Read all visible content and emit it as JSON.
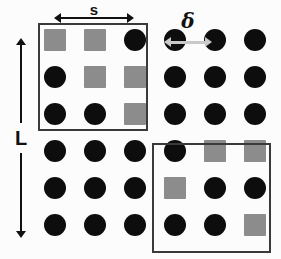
{
  "figure": {
    "width": 281,
    "height": 259,
    "background_color": "#fcfcfc"
  },
  "colors": {
    "circle": "#0d0d0d",
    "square": "#8c8c8c",
    "box_border": "#3a3a3a",
    "arrow_dark": "#111111",
    "arrow_light": "#c9c9c9"
  },
  "annotations": {
    "s": {
      "label": "s",
      "meaning": "domain-size-arrow",
      "orientation": "horizontal",
      "x": 54,
      "y": 4,
      "length": 80
    },
    "delta": {
      "label": "δ",
      "meaning": "lattice-spacing-arrow",
      "orientation": "horizontal",
      "x": 164,
      "y": 14,
      "length": 48
    },
    "L": {
      "label": "L",
      "meaning": "system-size-arrow",
      "orientation": "vertical",
      "x": 11,
      "y": 38,
      "length": 200
    }
  },
  "lattice": {
    "rows": 6,
    "cols": 6,
    "site_size": 22,
    "origin_x": 44,
    "origin_y": 29,
    "step_x": 40,
    "step_y": 37,
    "sites": [
      [
        "square",
        "square",
        "circle",
        "circle",
        "circle",
        "circle"
      ],
      [
        "circle",
        "square",
        "square",
        "circle",
        "circle",
        "circle"
      ],
      [
        "circle",
        "circle",
        "square",
        "circle",
        "circle",
        "circle"
      ],
      [
        "circle",
        "circle",
        "circle",
        "circle",
        "square",
        "square"
      ],
      [
        "circle",
        "circle",
        "circle",
        "square",
        "circle",
        "circle"
      ],
      [
        "circle",
        "circle",
        "circle",
        "circle",
        "circle",
        "square"
      ]
    ]
  },
  "domain_boxes": [
    {
      "name": "top-left-domain",
      "x": 38,
      "y": 23,
      "width": 110,
      "height": 108
    },
    {
      "name": "bottom-right-domain",
      "x": 152,
      "y": 143,
      "width": 119,
      "height": 110
    }
  ]
}
